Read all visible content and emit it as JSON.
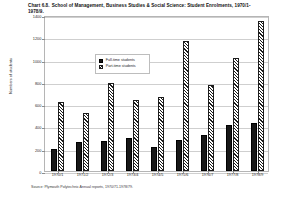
{
  "title": {
    "number": "Chart 6.8.",
    "text": "School of Management, Business Studies & Social Science: Student Enrolments, 1970/1-1978/9."
  },
  "source": "Source: Plymouth Polytechnic Annual reports, 1970/71-1978/79.",
  "legend": {
    "items": [
      {
        "label": "Full-time students",
        "pattern": "solid-black",
        "color": "#171717"
      },
      {
        "label": "Part-time students",
        "pattern": "diagonal-hatch",
        "color": "#1d1d1d"
      }
    ]
  },
  "chart_data": {
    "type": "bar",
    "xlabel": "",
    "ylabel": "Numbers of students",
    "ylim": [
      0,
      1400
    ],
    "yticks": [
      0,
      200,
      400,
      600,
      800,
      1000,
      1200,
      1400
    ],
    "ytick_labels": [
      "0",
      "200",
      "400",
      "600",
      "800",
      "1000",
      "1200",
      "1400"
    ],
    "grid": true,
    "legend_position": "upper-left-inside",
    "categories": [
      "1970/1",
      "1971/2",
      "1972/3",
      "1973/4",
      "1974/5",
      "1975/6",
      "1976/7",
      "1977/8",
      "1978/9"
    ],
    "series": [
      {
        "name": "Full-time students",
        "values": [
          200,
          260,
          265,
          300,
          215,
          280,
          320,
          415,
          430
        ]
      },
      {
        "name": "Part-time students",
        "values": [
          620,
          520,
          790,
          640,
          660,
          1170,
          770,
          1010,
          1350
        ]
      }
    ]
  }
}
